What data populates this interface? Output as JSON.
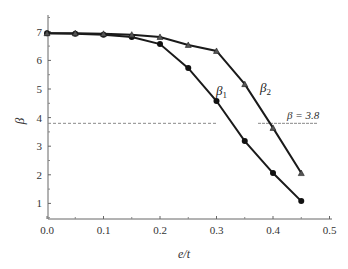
{
  "chart_data": {
    "type": "line",
    "title": "",
    "xlabel": "e/t",
    "ylabel": "β",
    "xlim": [
      0.0,
      0.5
    ],
    "ylim": [
      0.5,
      7.5
    ],
    "grid": false,
    "x": [
      0.0,
      0.05,
      0.1,
      0.15,
      0.2,
      0.25,
      0.3,
      0.35,
      0.4,
      0.45
    ],
    "x_ticks": [
      "0.0",
      "0.1",
      "0.2",
      "0.3",
      "0.4",
      "0.5"
    ],
    "y_ticks": [
      "1",
      "2",
      "3",
      "4",
      "5",
      "6",
      "7"
    ],
    "series": [
      {
        "name": "β1",
        "label_main": "β",
        "label_sub": "1",
        "marker": "circle",
        "values": [
          6.95,
          6.93,
          6.9,
          6.82,
          6.57,
          5.73,
          4.58,
          3.18,
          2.06,
          1.08
        ]
      },
      {
        "name": "β2",
        "label_main": "β",
        "label_sub": "2",
        "marker": "triangle",
        "values": [
          6.95,
          6.95,
          6.93,
          6.9,
          6.82,
          6.54,
          6.33,
          5.17,
          3.64,
          2.06
        ]
      }
    ],
    "reference_line": {
      "value": 3.8,
      "style": "dashed",
      "label": "β = 3.8"
    },
    "legend_position": "inline labels near curves"
  }
}
